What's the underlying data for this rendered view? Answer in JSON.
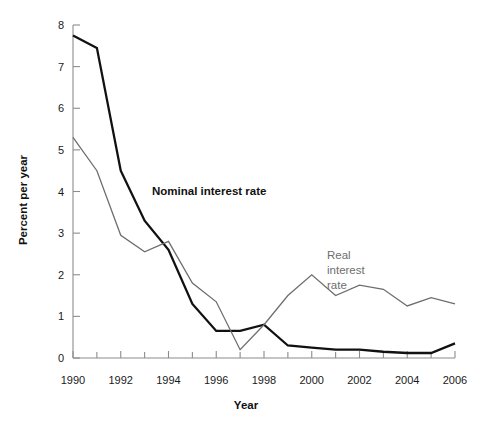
{
  "chart_data": {
    "type": "line",
    "title": "",
    "xlabel": "Year",
    "ylabel": "Percent per year",
    "xlim": [
      1990,
      2006
    ],
    "ylim": [
      0,
      8
    ],
    "grid": false,
    "legend_position": "inline-annotations",
    "x": [
      1990,
      1991,
      1992,
      1993,
      1994,
      1995,
      1996,
      1997,
      1998,
      1999,
      2000,
      2001,
      2002,
      2003,
      2004,
      2005,
      2006
    ],
    "xticks_major": [
      "1990",
      "1992",
      "1994",
      "1996",
      "1998",
      "2000",
      "2002",
      "2004",
      "2006"
    ],
    "xticks_major_values": [
      1990,
      1992,
      1994,
      1996,
      1998,
      2000,
      2002,
      2004,
      2006
    ],
    "xticks_minor_values": [
      1991,
      1993,
      1995,
      1997,
      1999,
      2001,
      2003,
      2005
    ],
    "yticks": [
      "0",
      "1",
      "2",
      "3",
      "4",
      "5",
      "6",
      "7",
      "8"
    ],
    "ytick_values": [
      0,
      1,
      2,
      3,
      4,
      5,
      6,
      7,
      8
    ],
    "series": [
      {
        "name": "Nominal interest rate",
        "color": "#111111",
        "width": 2.3,
        "values": [
          7.75,
          7.45,
          4.5,
          3.3,
          2.6,
          1.3,
          0.65,
          0.65,
          0.8,
          0.3,
          0.25,
          0.2,
          0.2,
          0.15,
          0.12,
          0.12,
          0.35
        ]
      },
      {
        "name": "Real interest rate",
        "color": "#6e6e6e",
        "width": 1.3,
        "values": [
          5.3,
          4.5,
          2.95,
          2.55,
          2.8,
          1.8,
          1.35,
          0.2,
          0.8,
          1.5,
          2.0,
          1.5,
          1.75,
          1.65,
          1.25,
          1.45,
          1.3
        ]
      }
    ],
    "annotations": [
      {
        "text": "Nominal interest rate",
        "x": 1993.2,
        "y": 4.15,
        "color": "#111111",
        "bold": true
      },
      {
        "text": "Real interest rate",
        "x": 2000.6,
        "y": 2.75,
        "color": "#6e6e6e",
        "bold": false
      }
    ]
  },
  "labels": {
    "axis_x_title": "Year",
    "axis_y_title": "Percent per year",
    "annotation_nominal": "Nominal interest rate",
    "annotation_real_line1": "Real",
    "annotation_real_line2": "interest",
    "annotation_real_line3": "rate"
  },
  "colors": {
    "nominal": "#111111",
    "real": "#6e6e6e",
    "axis": "#8c8c8c",
    "text": "#1a1a1a",
    "background": "#ffffff"
  }
}
